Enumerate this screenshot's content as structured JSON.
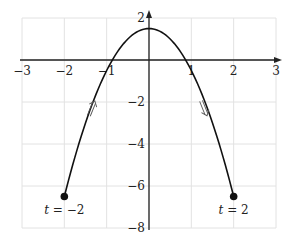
{
  "chart_data": {
    "type": "line",
    "title": "",
    "xlabel": "",
    "ylabel": "",
    "xlim": [
      -3,
      3
    ],
    "ylim": [
      -8,
      2
    ],
    "grid": true,
    "x_ticks": [
      -3,
      -2,
      -1,
      1,
      2,
      3
    ],
    "y_ticks": [
      2,
      -2,
      -4,
      -6,
      -8
    ],
    "x_tick_labels": [
      "−3",
      "−2",
      "−1",
      "1",
      "2",
      "3"
    ],
    "y_tick_labels": [
      "2",
      "−2",
      "−4",
      "−6",
      "−8"
    ],
    "series": [
      {
        "name": "parametric curve",
        "expression": "y = 1.5 - 2x^2",
        "t_range": [
          -2,
          2
        ],
        "x": [
          -2,
          -1.5,
          -1,
          -0.5,
          0,
          0.5,
          1,
          1.5,
          2
        ],
        "y": [
          -6.5,
          -3,
          -0.5,
          1,
          1.5,
          1,
          -0.5,
          -3,
          -6.5
        ]
      }
    ],
    "points": [
      {
        "x": -2,
        "y": -6.5,
        "label": "t = −2"
      },
      {
        "x": 2,
        "y": -6.5,
        "label": "t = 2"
      }
    ],
    "annotations": [
      {
        "type": "direction-arrow",
        "glyph": "⇗",
        "near": [
          -1.35,
          -2.3
        ],
        "meaning": "moving up"
      },
      {
        "type": "direction-arrow",
        "glyph": "⇘",
        "near": [
          1.3,
          -2.3
        ],
        "meaning": "moving down"
      }
    ]
  },
  "labels": {
    "start": "t = −2",
    "end": "t = 2"
  }
}
